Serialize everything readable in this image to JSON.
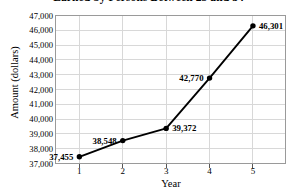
{
  "chart_data": {
    "type": "line",
    "title": "Earned by Persons Between 25 and 34",
    "xlabel": "Year",
    "ylabel": "Amount (dollars)",
    "categories": [
      "1",
      "2",
      "3",
      "4",
      "5"
    ],
    "x": [
      1,
      2,
      3,
      4,
      5
    ],
    "values": [
      37455,
      38548,
      39372,
      42770,
      46301
    ],
    "point_labels": [
      "37,455",
      "38,548",
      "39,372",
      "42,770",
      "46,301"
    ],
    "label_positions": [
      "left",
      "left",
      "right",
      "left",
      "right"
    ],
    "ylim": [
      37000,
      47000
    ],
    "xlim": [
      0.45,
      5.75
    ],
    "ytick_values": [
      37000,
      38000,
      39000,
      40000,
      41000,
      42000,
      43000,
      44000,
      45000,
      46000,
      47000
    ],
    "ytick_labels": [
      "37,000",
      "38,000",
      "39,000",
      "40,000",
      "41,000",
      "42,000",
      "43,000",
      "44,000",
      "45,000",
      "46,000",
      "47,000"
    ],
    "grid": true,
    "grid_color": "#d8d8d8",
    "legend": "none",
    "line_color": "#000000",
    "marker": "circle",
    "marker_color": "#000000",
    "frame_color": "#9a9a9a",
    "background": "#ffffff"
  }
}
